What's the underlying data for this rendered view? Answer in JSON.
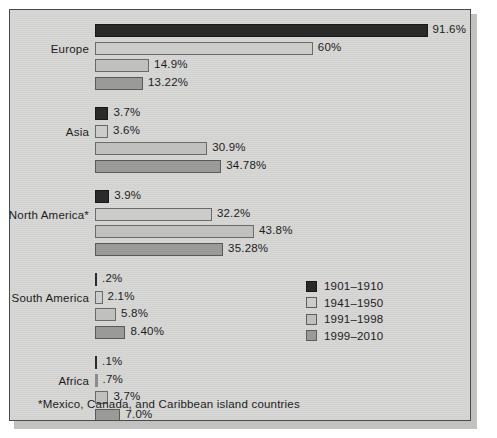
{
  "chart_data": {
    "type": "bar",
    "orientation": "horizontal",
    "title": "",
    "xlabel": "",
    "ylabel": "",
    "grid": false,
    "xlim": [
      0,
      100
    ],
    "legend_position": "middle-right",
    "categories": [
      "Europe",
      "Asia",
      "North America*",
      "South America",
      "Africa"
    ],
    "series": [
      {
        "name": "1901-1910",
        "color": "#2a2a2a",
        "values": [
          91.6,
          3.7,
          3.9,
          0.2,
          0.1
        ],
        "labels": [
          "91.6%",
          "3.7%",
          "3.9%",
          ".2%",
          ".1%"
        ]
      },
      {
        "name": "1941-1950",
        "color": "#cccccb",
        "values": [
          60,
          3.6,
          32.2,
          2.1,
          0.7
        ],
        "labels": [
          "60%",
          "3.6%",
          "32.2%",
          "2.1%",
          ".7%"
        ]
      },
      {
        "name": "1991-1998",
        "color": "#c0c0bf",
        "values": [
          14.9,
          30.9,
          43.8,
          5.8,
          3.7
        ],
        "labels": [
          "14.9%",
          "30.9%",
          "43.8%",
          "5.8%",
          "3.7%"
        ]
      },
      {
        "name": "1999-2010",
        "color": "#9a9a99",
        "values": [
          13.22,
          34.78,
          35.28,
          8.4,
          7.0
        ],
        "labels": [
          "13.22%",
          "34.78%",
          "35.28%",
          "8.40%",
          "7.0%"
        ]
      }
    ]
  },
  "legend": {
    "items": [
      {
        "label": "1901–1910"
      },
      {
        "label": "1941–1950"
      },
      {
        "label": "1991–1998"
      },
      {
        "label": "1999–2010"
      }
    ]
  },
  "footnote": "*Mexico, Canada, and Caribbean island countries",
  "axis": {
    "labels": [
      "Europe",
      "Asia",
      "North America*",
      "South America",
      "Africa"
    ]
  },
  "values": {
    "europe": [
      "91.6%",
      "60%",
      "14.9%",
      "13.22%"
    ],
    "asia": [
      "3.7%",
      "3.6%",
      "30.9%",
      "34.78%"
    ],
    "north_america": [
      "3.9%",
      "32.2%",
      "43.8%",
      "35.28%"
    ],
    "south_america": [
      ".2%",
      "2.1%",
      "5.8%",
      "8.40%"
    ],
    "africa": [
      ".1%",
      ".7%",
      "3.7%",
      "7.0%"
    ]
  }
}
